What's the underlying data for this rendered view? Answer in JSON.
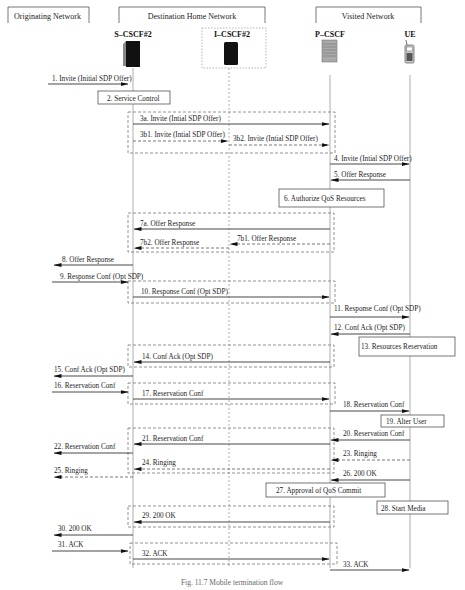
{
  "networks": [
    {
      "id": "originating",
      "label": "Originating Network"
    },
    {
      "id": "destination",
      "label": "Destination Home Network"
    },
    {
      "id": "visited",
      "label": "Visited Network"
    }
  ],
  "nodes": [
    {
      "id": "scscf",
      "label": "S–CSCF#2",
      "icon": "server-tower-icon"
    },
    {
      "id": "icscf",
      "label": "I–CSCF#2",
      "icon": "server-tower-icon"
    },
    {
      "id": "pcscf",
      "label": "P–CSCF",
      "icon": "server-rack-icon"
    },
    {
      "id": "ue",
      "label": "UE",
      "icon": "mobile-phone-icon"
    }
  ],
  "messages": [
    {
      "n": "1",
      "label": "1. Invite (Initial SDP Offer)",
      "from": "orig",
      "to": "scscf",
      "style": "solid"
    },
    {
      "n": "3a",
      "label": "3a. Invite (Intial SDP Offer)",
      "from": "scscf",
      "to": "pcscf",
      "style": "solid"
    },
    {
      "n": "3b1",
      "label": "3b1. Invite (Intial SDP Offer)",
      "from": "scscf",
      "to": "icscf",
      "style": "dashed"
    },
    {
      "n": "3b2",
      "label": "3b2. Invite (Intial SDP Offer)",
      "from": "icscf",
      "to": "pcscf",
      "style": "dashed"
    },
    {
      "n": "4",
      "label": "4. Invite (Intial SDP Offer)",
      "from": "pcscf",
      "to": "ue",
      "style": "solid"
    },
    {
      "n": "5",
      "label": "5. Offer Response",
      "from": "ue",
      "to": "pcscf",
      "style": "solid"
    },
    {
      "n": "7a",
      "label": "7a. Offer Response",
      "from": "pcscf",
      "to": "scscf",
      "style": "solid"
    },
    {
      "n": "7b1",
      "label": "7b1. Offer Response",
      "from": "pcscf",
      "to": "icscf",
      "style": "dashed"
    },
    {
      "n": "7b2",
      "label": "7b2. Offer Response",
      "from": "icscf",
      "to": "scscf",
      "style": "dashed"
    },
    {
      "n": "8",
      "label": "8. Offer Response",
      "from": "scscf",
      "to": "orig",
      "style": "solid"
    },
    {
      "n": "9",
      "label": "9. Response Conf (Opt SDP)",
      "from": "orig",
      "to": "scscf",
      "style": "solid"
    },
    {
      "n": "10",
      "label": "10. Response Conf (Opt SDP)",
      "from": "scscf",
      "to": "pcscf",
      "style": "solid"
    },
    {
      "n": "11",
      "label": "11. Response Conf (Opt SDP)",
      "from": "pcscf",
      "to": "ue",
      "style": "solid"
    },
    {
      "n": "12",
      "label": "12. Conf Ack (Opt SDP)",
      "from": "ue",
      "to": "pcscf",
      "style": "solid"
    },
    {
      "n": "14",
      "label": "14. Conf Ack (Opt SDP)",
      "from": "pcscf",
      "to": "scscf",
      "style": "solid"
    },
    {
      "n": "15",
      "label": "15. Conf Ack (Opt SDP)",
      "from": "scscf",
      "to": "orig",
      "style": "solid"
    },
    {
      "n": "16",
      "label": "16. Reservation Conf",
      "from": "orig",
      "to": "scscf",
      "style": "solid"
    },
    {
      "n": "17",
      "label": "17. Reservation Conf",
      "from": "scscf",
      "to": "pcscf",
      "style": "solid"
    },
    {
      "n": "18",
      "label": "18. Reservation Conf",
      "from": "pcscf",
      "to": "ue",
      "style": "solid"
    },
    {
      "n": "20",
      "label": "20. Reservation Conf",
      "from": "ue",
      "to": "pcscf",
      "style": "solid"
    },
    {
      "n": "21",
      "label": "21. Reservation Conf",
      "from": "pcscf",
      "to": "scscf",
      "style": "solid"
    },
    {
      "n": "22",
      "label": "22. Reservation Conf",
      "from": "scscf",
      "to": "orig",
      "style": "solid"
    },
    {
      "n": "23",
      "label": "23. Ringing",
      "from": "ue",
      "to": "pcscf",
      "style": "dashed"
    },
    {
      "n": "24",
      "label": "24. Ringing",
      "from": "pcscf",
      "to": "scscf",
      "style": "dashed"
    },
    {
      "n": "25",
      "label": "25. Ringing",
      "from": "scscf",
      "to": "orig",
      "style": "dashed"
    },
    {
      "n": "26",
      "label": "26. 200 OK",
      "from": "ue",
      "to": "pcscf",
      "style": "solid"
    },
    {
      "n": "29",
      "label": "29. 200 OK",
      "from": "pcscf",
      "to": "scscf",
      "style": "solid"
    },
    {
      "n": "30",
      "label": "30. 200 OK",
      "from": "scscf",
      "to": "orig",
      "style": "solid"
    },
    {
      "n": "31",
      "label": "31. ACK",
      "from": "orig",
      "to": "scscf",
      "style": "solid"
    },
    {
      "n": "32",
      "label": "32. ACK",
      "from": "scscf",
      "to": "pcscf",
      "style": "solid"
    },
    {
      "n": "33",
      "label": "33. ACK",
      "from": "pcscf",
      "to": "ue",
      "style": "solid"
    }
  ],
  "actions": [
    {
      "n": "2",
      "label": "2. Service Control"
    },
    {
      "n": "6",
      "label": "6. Authorize QoS Resources"
    },
    {
      "n": "13",
      "label": "13. Resources Reservation"
    },
    {
      "n": "19",
      "label": "19. Alter User"
    },
    {
      "n": "27",
      "label": "27. Approval of QoS Commit"
    },
    {
      "n": "28",
      "label": "28. Start Media"
    }
  ],
  "caption": "Fig. 11.7 Mobile termination flow"
}
